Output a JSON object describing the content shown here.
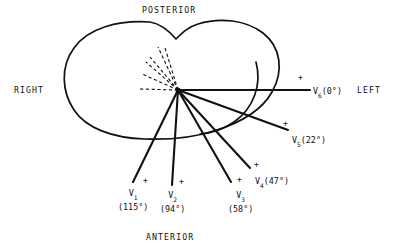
{
  "figure": {
    "background_color": "#ffffff",
    "line_color": "#111111"
  },
  "orientation": {
    "posterior": "POSTERIOR",
    "anterior": "ANTERIOR",
    "right": "RIGHT",
    "left": "LEFT"
  },
  "polarity_marker": "+",
  "origin": {
    "x": 178,
    "y": 90
  },
  "leads": [
    {
      "name": "V",
      "subscript": "1",
      "angle_text": "(115°)",
      "angle_deg": 115,
      "label_layout": "stacked",
      "label_x": 118,
      "label_y": 188,
      "plus_x": 143,
      "plus_y": 177,
      "tip_x": 133,
      "tip_y": 182
    },
    {
      "name": "V",
      "subscript": "2",
      "angle_text": "(94°)",
      "angle_deg": 94,
      "label_layout": "stacked",
      "label_x": 160,
      "label_y": 190,
      "plus_x": 179,
      "plus_y": 178,
      "tip_x": 172,
      "tip_y": 185
    },
    {
      "name": "V",
      "subscript": "3",
      "angle_text": "(58°)",
      "angle_deg": 58,
      "label_layout": "stacked",
      "label_x": 228,
      "label_y": 190,
      "plus_x": 237,
      "plus_y": 176,
      "tip_x": 231,
      "tip_y": 182
    },
    {
      "name": "V",
      "subscript": "4",
      "angle_text": "(47°)",
      "angle_deg": 47,
      "label_layout": "inline",
      "label_x": 255,
      "label_y": 176,
      "plus_x": 254,
      "plus_y": 161,
      "tip_x": 250,
      "tip_y": 168
    },
    {
      "name": "V",
      "subscript": "5",
      "angle_text": "(22°)",
      "angle_deg": 22,
      "label_layout": "inline",
      "label_x": 292,
      "label_y": 135,
      "plus_x": 283,
      "plus_y": 120,
      "tip_x": 288,
      "tip_y": 130
    },
    {
      "name": "V",
      "subscript": "6",
      "angle_text": "(0°)",
      "angle_deg": 0,
      "label_layout": "inline",
      "label_x": 313,
      "label_y": 86,
      "plus_x": 298,
      "plus_y": 74,
      "tip_x": 310,
      "tip_y": 90
    }
  ]
}
